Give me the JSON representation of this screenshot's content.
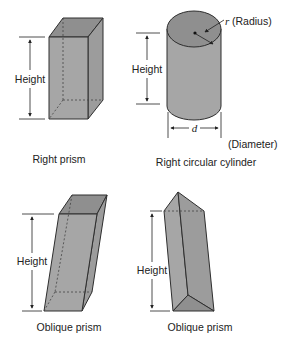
{
  "figures": [
    {
      "id": "right-prism",
      "caption": "Right prism",
      "dimension_label": "Height"
    },
    {
      "id": "right-circular-cylinder",
      "caption": "Right circular cylinder",
      "dimension_label": "Height",
      "radius_symbol": "r",
      "radius_label": "(Radius)",
      "diameter_symbol": "d",
      "diameter_label": "(Diameter)"
    },
    {
      "id": "oblique-prism-rectangular",
      "caption": "Oblique prism",
      "dimension_label": "Height"
    },
    {
      "id": "oblique-prism-triangular",
      "caption": "Oblique prism",
      "dimension_label": "Height"
    }
  ],
  "colors": {
    "solid_fill": "#a6a6a6",
    "top_fill": "#8f8f8f",
    "outline": "#2e2e2e",
    "background": "#ffffff"
  }
}
